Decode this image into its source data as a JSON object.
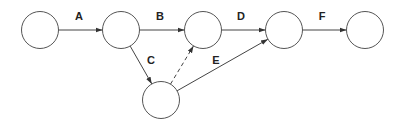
{
  "diagram": {
    "type": "activity-on-arrow network",
    "nodes": [
      {
        "id": "n1",
        "cx": 40,
        "cy": 30,
        "r": 18.5
      },
      {
        "id": "n2",
        "cx": 121,
        "cy": 30,
        "r": 18.5
      },
      {
        "id": "n3",
        "cx": 203,
        "cy": 30,
        "r": 18.5
      },
      {
        "id": "n4",
        "cx": 284,
        "cy": 30,
        "r": 18.5
      },
      {
        "id": "n5",
        "cx": 365,
        "cy": 30,
        "r": 18.5
      },
      {
        "id": "n6",
        "cx": 161,
        "cy": 100,
        "r": 18.5
      }
    ],
    "edges": [
      {
        "label": "A",
        "from": "n1",
        "to": "n2",
        "style": "solid",
        "label_x": 79,
        "label_y": 17
      },
      {
        "label": "B",
        "from": "n2",
        "to": "n3",
        "style": "solid",
        "label_x": 160,
        "label_y": 17
      },
      {
        "label": "C",
        "from": "n2",
        "to": "n6",
        "style": "solid",
        "label_x": 151,
        "label_y": 61
      },
      {
        "label": "",
        "from": "n6",
        "to": "n3",
        "style": "dashed",
        "label_x": null,
        "label_y": null
      },
      {
        "label": "D",
        "from": "n3",
        "to": "n4",
        "style": "solid",
        "label_x": 241,
        "label_y": 17
      },
      {
        "label": "E",
        "from": "n6",
        "to": "n4",
        "style": "solid",
        "label_x": 216,
        "label_y": 61
      },
      {
        "label": "F",
        "from": "n4",
        "to": "n5",
        "style": "solid",
        "label_x": 322,
        "label_y": 17
      }
    ],
    "colors": {
      "node_stroke": "#555555",
      "edge_stroke": "#444444",
      "label": "#222222",
      "background": "#ffffff"
    }
  }
}
